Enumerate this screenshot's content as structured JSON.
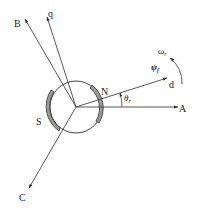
{
  "diagram": {
    "type": "pmsm-vector-diagram",
    "colors": {
      "line": "#444444",
      "magnet": "#9a9a9a",
      "magnet_stroke": "#333333",
      "background": "#ffffff"
    },
    "axes": {
      "A": {
        "label": "A"
      },
      "B": {
        "label": "B"
      },
      "C": {
        "label": "C"
      },
      "d": {
        "label": "d"
      },
      "q": {
        "label": "q"
      }
    },
    "poles": {
      "north": "N",
      "south": "S"
    },
    "annotations": {
      "angle_symbol": "θ",
      "angle_subscript": "r",
      "flux_symbol": "ψ",
      "flux_subscript": "f",
      "speed_symbol": "ω",
      "speed_subscript": "r"
    }
  }
}
